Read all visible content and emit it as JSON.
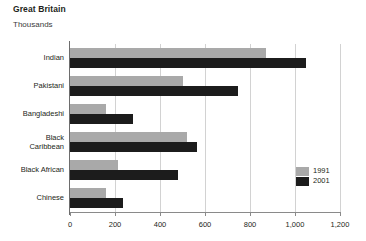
{
  "header": {
    "title": "Great Britain",
    "subtitle": "Thousands"
  },
  "legend": {
    "items": [
      {
        "label": "1991",
        "color": "#a9a9a9",
        "name": "legend-1991"
      },
      {
        "label": "2001",
        "color": "#1c1c1c",
        "name": "legend-2001"
      }
    ]
  },
  "axis": {
    "x_ticks": [
      "0",
      "200",
      "400",
      "600",
      "800",
      "1,000",
      "1,200"
    ],
    "x_tick_values": [
      0,
      200,
      400,
      600,
      800,
      1000,
      1200
    ]
  },
  "categories_display": [
    [
      "Indian"
    ],
    [
      "Pakistani"
    ],
    [
      "Bangladeshi"
    ],
    [
      "Black",
      "Caribbean"
    ],
    [
      "Black African"
    ],
    [
      "Chinese"
    ]
  ],
  "chart_data": {
    "type": "bar",
    "orientation": "horizontal",
    "title": "Great Britain",
    "subtitle": "Thousands",
    "xlabel": "Thousands",
    "ylabel": "",
    "xlim": [
      0,
      1200
    ],
    "grid": true,
    "legend_position": "inside-right",
    "categories": [
      "Indian",
      "Pakistani",
      "Bangladeshi",
      "Black Caribbean",
      "Black African",
      "Chinese"
    ],
    "series": [
      {
        "name": "1991",
        "color": "#a9a9a9",
        "values": [
          870,
          500,
          160,
          520,
          215,
          160
        ]
      },
      {
        "name": "2001",
        "color": "#1c1c1c",
        "values": [
          1050,
          745,
          280,
          565,
          480,
          235
        ]
      }
    ]
  }
}
